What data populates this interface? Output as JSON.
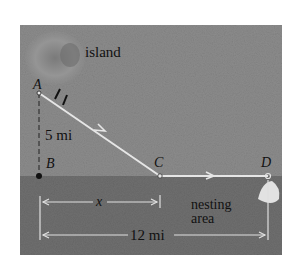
{
  "figure": {
    "colors": {
      "sky": "#8d8d8d",
      "water": "#6e6e6e",
      "path": "#e4e4e4",
      "island": "#9a9a9a",
      "nest": "#e6e6e6",
      "text": "#111111"
    },
    "labels": {
      "island": "island",
      "point_a": "A",
      "point_b": "B",
      "point_c": "C",
      "point_d": "D",
      "dist_ab": "5 mi",
      "var_x": "x",
      "nesting_line1": "nesting",
      "nesting_line2": "area",
      "dist_bd": "12 mi"
    }
  }
}
